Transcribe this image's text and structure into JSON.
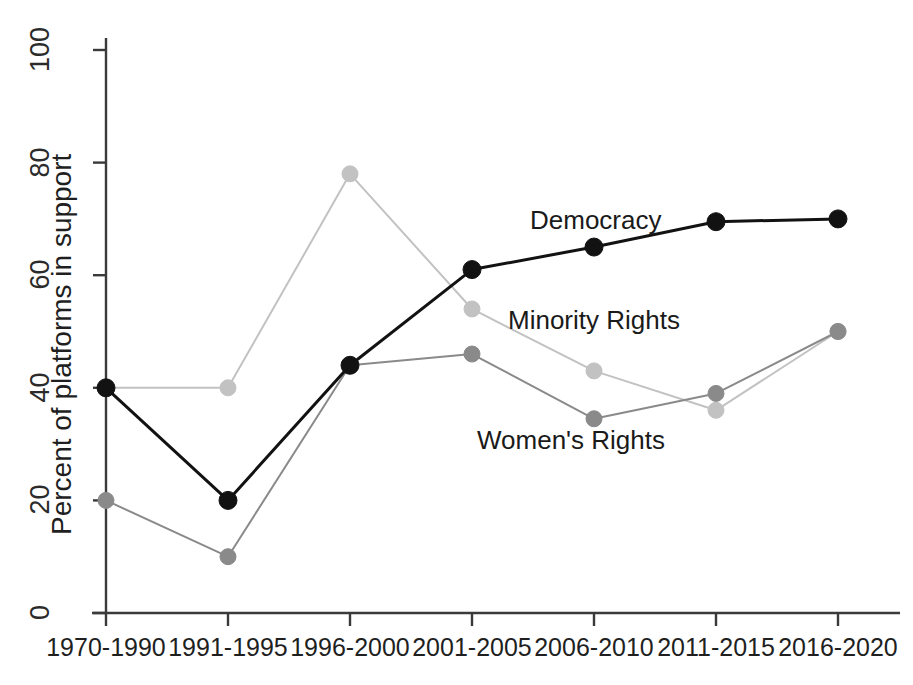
{
  "chart_data": {
    "type": "line",
    "title": "",
    "subtitle": "",
    "xlabel": "",
    "ylabel": "Percent of platforms in support",
    "categories": [
      "1970-1990",
      "1991-1995",
      "1996-2000",
      "2001-2005",
      "2006-2010",
      "2011-2015",
      "2016-2020"
    ],
    "ylim": [
      0,
      100
    ],
    "yticks": [
      0,
      20,
      40,
      60,
      80,
      100
    ],
    "ytick_labels": [
      "0",
      "20",
      "40",
      "60",
      "80",
      "100"
    ],
    "grid": false,
    "legend_position": "inline-annotations",
    "series": [
      {
        "name": "Democracy",
        "color": "#121212",
        "marker": "circle",
        "line_width": 3.0,
        "values": [
          40,
          20,
          44,
          61,
          65,
          69.5,
          70
        ]
      },
      {
        "name": "Minority Rights",
        "color": "#c2c2c2",
        "marker": "circle",
        "line_width": 2.0,
        "values": [
          40,
          40,
          78,
          54,
          43,
          36,
          50
        ]
      },
      {
        "name": "Women's Rights",
        "color": "#8a8a8a",
        "marker": "circle",
        "line_width": 2.0,
        "values": [
          20,
          10,
          44,
          46,
          34.5,
          39,
          50
        ]
      }
    ],
    "annotations": [
      {
        "text": "Democracy",
        "x_px": 530,
        "y_px": 205
      },
      {
        "text": "Minority Rights",
        "x_px": 508,
        "y_px": 305
      },
      {
        "text": "Women's Rights",
        "x_px": 477,
        "y_px": 425
      }
    ],
    "axis_color": "#3a3a3a"
  }
}
